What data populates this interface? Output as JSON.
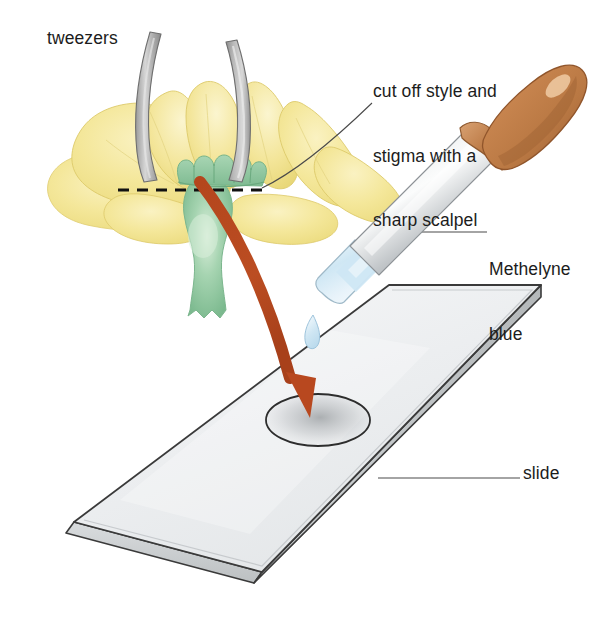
{
  "diagram": {
    "background_color": "#ffffff",
    "labels": {
      "tweezers": "tweezers",
      "scalpel_line1": "cut off style and",
      "scalpel_line2": "stigma with a",
      "scalpel_line3": "sharp scalpel",
      "stain_line1": "Methelyne",
      "stain_line2": "blue",
      "slide": "slide"
    },
    "colors": {
      "petal_fill": "#f2e48f",
      "petal_fill_light": "#f7eeb4",
      "petal_edge": "#ddc96a",
      "ovary_green": "#8fc69f",
      "ovary_green_dark": "#6fae84",
      "ovary_highlight": "#d3e8d3",
      "tweezer_gray": "#a8a8a8",
      "tweezer_gray_light": "#cfcfcf",
      "tweezer_outline": "#6f6f6f",
      "arrow_red": "#b8481f",
      "handle_brown": "#c1seq",
      "handle_brown_hex": "#c3804f",
      "handle_brown_dark": "#a6653a",
      "handle_highlight": "#e3b58c",
      "metal_light": "#f2f3f4",
      "metal_mid": "#b9bdc0",
      "metal_dark": "#8d9296",
      "glass_blue": "#d8eaf5",
      "glass_blue_deep": "#bcdcef",
      "droplet_blue": "#cfe6f3",
      "slide_face": "#eaecee",
      "slide_face_light": "#f4f5f6",
      "slide_edge": "#3a3a3a",
      "slide_side": "#c8cccd",
      "drop_smear": "#b9bcbe",
      "leader_line": "#4a4a4a",
      "cut_line": "#111111",
      "text": "#1c1c1c"
    },
    "elements": {
      "flower": "yellow flower with green ovary and lobed stigma crown",
      "tweezers": "two curved gray tweezer arms gripping the flower",
      "cut_line": "black horizontal dashed line marking the cut",
      "dropper": "brown-handled dropper with metal shaft and pale blue methylene blue",
      "droplet": "falling pale blue droplet",
      "arrow": "curved red-brown arrow from cut site to slide",
      "slide": "microscope slide shown in perspective with a specimen drop"
    }
  }
}
